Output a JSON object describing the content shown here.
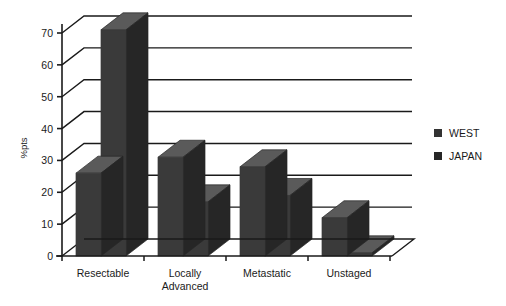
{
  "chart_data": {
    "type": "bar",
    "title": "",
    "subtitle": "",
    "xlabel": "",
    "ylabel": "%pts",
    "ylim": [
      0,
      70
    ],
    "ytick_step": 10,
    "yticks": [
      "0",
      "10",
      "20",
      "30",
      "40",
      "50",
      "60",
      "70"
    ],
    "grid": true,
    "style": "3d-clustered-column",
    "legend_position": "right",
    "categories": [
      "Resectable",
      "Locally Advanced",
      "Metastatic",
      "Unstaged"
    ],
    "category_lines": [
      [
        "Resectable"
      ],
      [
        "Locally",
        "Advanced"
      ],
      [
        "Metastatic"
      ],
      [
        "Unstaged"
      ]
    ],
    "series": [
      {
        "name": "WEST",
        "color": "#3a3a3a",
        "values": [
          26,
          31,
          28,
          12
        ]
      },
      {
        "name": "JAPAN",
        "color": "#2b2b2b",
        "values": [
          71,
          17,
          19,
          1
        ]
      }
    ]
  },
  "legend": {
    "items": [
      {
        "label": "WEST",
        "swatch_color": "#333333"
      },
      {
        "label": "JAPAN",
        "swatch_color": "#262626"
      }
    ]
  },
  "axis": {
    "y_title": "%pts"
  },
  "colors": {
    "bar_front": "#3a3a3a",
    "bar_top": "#5a5a5a",
    "bar_side": "#262626",
    "axis_line": "#1a1a1a",
    "grid_line": "#1a1a1a",
    "background": "#ffffff"
  }
}
